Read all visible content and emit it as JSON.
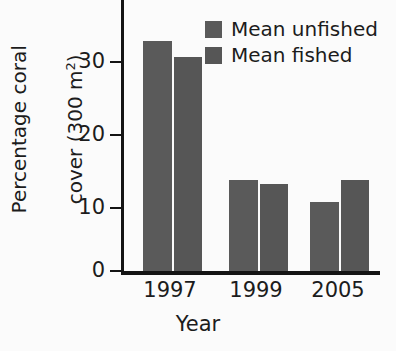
{
  "chart_data": {
    "type": "bar",
    "title": "",
    "subtitle": "",
    "xlabel": "Year",
    "ylabel": "Percentage coral cover (300 m2)",
    "ylabel_line1": "Percentage coral",
    "ylabel_line2_prefix": "cover (300 m",
    "ylabel_line2_sup": "2",
    "ylabel_line2_suffix": ")",
    "categories": [
      "1997",
      "1999",
      "2005"
    ],
    "series": [
      {
        "name": "Mean unfished",
        "color": "#5a5a5a",
        "values": [
          29.7,
          11.8,
          8.9
        ]
      },
      {
        "name": "Mean fished",
        "color": "#565656",
        "values": [
          27.6,
          11.3,
          11.8
        ]
      }
    ],
    "ylim": [
      0,
      35
    ],
    "yticks": [
      0,
      10,
      20,
      30
    ],
    "ytick_labels": [
      "0",
      "10",
      "20",
      "30"
    ],
    "grid": false,
    "legend_position": "top-right"
  },
  "legend": {
    "items": [
      {
        "label": "Mean unfished"
      },
      {
        "label": "Mean fished"
      }
    ]
  },
  "axes": {
    "x_title": "Year",
    "y_tick_0": "0",
    "y_tick_10": "10",
    "y_tick_20": "20",
    "y_tick_30": "30",
    "x_tick_0": "1997",
    "x_tick_1": "1999",
    "x_tick_2": "2005"
  }
}
